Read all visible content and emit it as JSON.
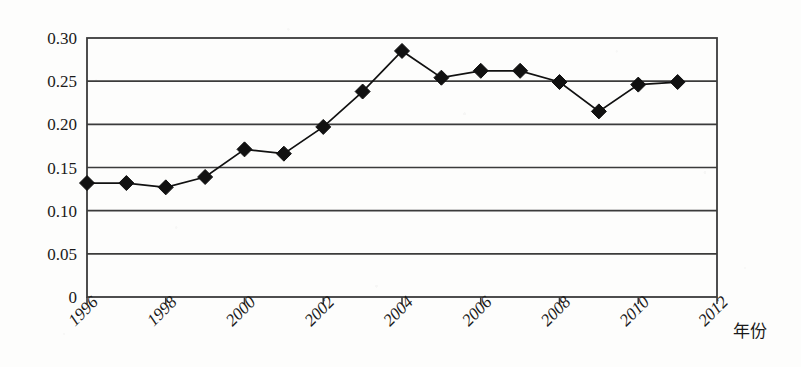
{
  "chart_data": {
    "type": "line",
    "title": "",
    "subtitle": "",
    "xlabel": "年份",
    "ylabel": "",
    "categories": [
      1996,
      1997,
      1998,
      1999,
      2000,
      2001,
      2002,
      2003,
      2004,
      2005,
      2006,
      2007,
      2008,
      2009,
      2010,
      2011
    ],
    "values": [
      0.132,
      0.132,
      0.127,
      0.139,
      0.171,
      0.166,
      0.197,
      0.238,
      0.285,
      0.254,
      0.262,
      0.262,
      0.249,
      0.215,
      0.246,
      0.249
    ],
    "series": [
      {
        "name": "series-1",
        "marker": "diamond",
        "color": "#111111",
        "values": [
          0.132,
          0.132,
          0.127,
          0.139,
          0.171,
          0.166,
          0.197,
          0.238,
          0.285,
          0.254,
          0.262,
          0.262,
          0.249,
          0.215,
          0.246,
          0.249
        ]
      }
    ],
    "xlim": [
      1996,
      2012
    ],
    "ylim": [
      0,
      0.3
    ],
    "ytick_labels": [
      "0.30",
      "0.25",
      "0.20",
      "0.15",
      "0.10",
      "0.05",
      "0"
    ],
    "ytick_values": [
      0.3,
      0.25,
      0.2,
      0.15,
      0.1,
      0.05,
      0
    ],
    "xtick_labels": [
      "1996",
      "1998",
      "2000",
      "2002",
      "2004",
      "2006",
      "2008",
      "2010",
      "2012"
    ],
    "xtick_values": [
      1996,
      1998,
      2000,
      2002,
      2004,
      2006,
      2008,
      2010,
      2012
    ],
    "grid": "horizontal",
    "legend": "none",
    "legend_position": "none",
    "annotations": []
  },
  "axis_title_x": "年份",
  "colors": {
    "line": "#111111",
    "marker": "#111111",
    "grid": "#3b3b3b",
    "frame": "#3b3b3b",
    "background": "#fdfdfc"
  }
}
